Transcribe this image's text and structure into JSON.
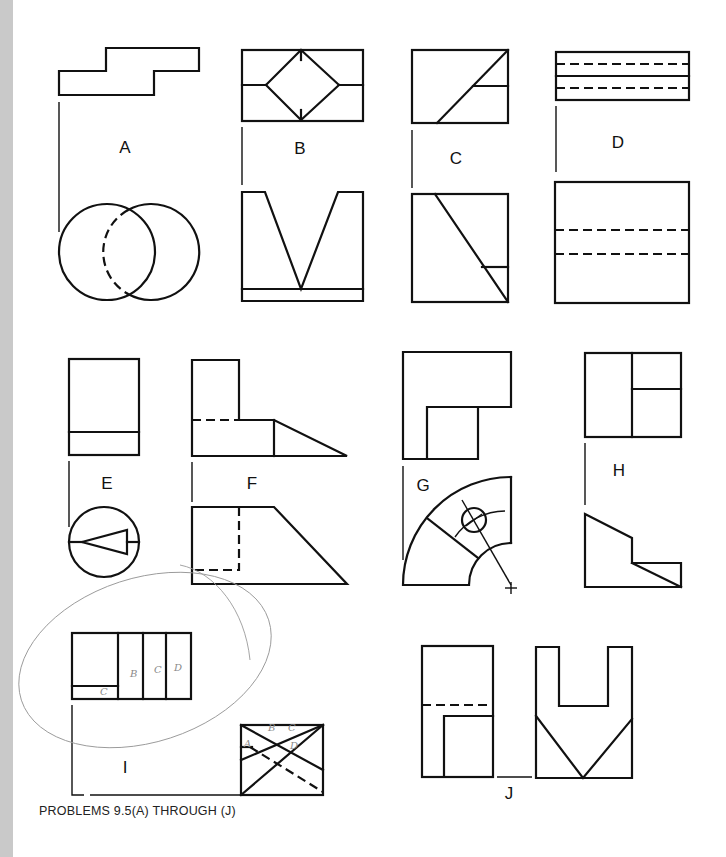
{
  "page": {
    "caption": "PROBLEMS 9.5(A) THROUGH (J)"
  },
  "problems": [
    {
      "id": "A",
      "label": "A",
      "top_view": "stepped Z-shaped outline",
      "front_view": "two overlapping circles with hidden arc"
    },
    {
      "id": "B",
      "label": "B",
      "top_view": "rectangle with inscribed diamond and centerline",
      "front_view": "V-groove block"
    },
    {
      "id": "C",
      "label": "C",
      "top_view": "rectangle with diagonal and short horizontal",
      "front_view": "square with diagonal and short horizontal"
    },
    {
      "id": "D",
      "label": "D",
      "top_view": "thin rectangle with two hidden lines and center line",
      "front_view": "rectangle with two hidden lines"
    },
    {
      "id": "E",
      "label": "E",
      "top_view": "rectangle with horizontal band",
      "front_view": "circle with triangle"
    },
    {
      "id": "F",
      "label": "F",
      "top_view": "L-shape with sloped wedge and hidden line",
      "front_view": "trapezoid with hidden rectangle"
    },
    {
      "id": "G",
      "label": "G",
      "top_view": "L-shape outline",
      "front_view": "quarter annulus with hole and center mark"
    },
    {
      "id": "H",
      "label": "H",
      "top_view": "square divided into three regions",
      "front_view": "stepped profile with slope"
    },
    {
      "id": "I",
      "label": "I",
      "top_view": "rectangle divided into four columns",
      "front_view": "rectangle with crossing diagonals and hidden lines"
    },
    {
      "id": "J",
      "label": "J",
      "top_view": "rectangle with hidden line and inner notch",
      "front_view": "U-shape with V bottom"
    }
  ],
  "annotations": {
    "handwritten": [
      "B",
      "C",
      "D",
      "C",
      "A",
      "B",
      "C",
      "D"
    ]
  }
}
